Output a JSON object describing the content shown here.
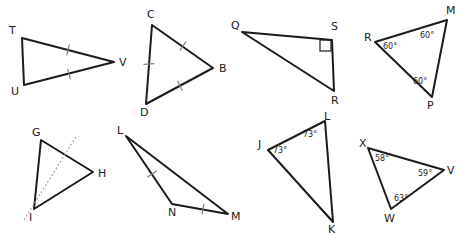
{
  "page": {
    "background_color": "#ffffff",
    "stroke_color": "#1b1b1b",
    "tick_color": "#808080",
    "dotted_color": "#9a9a9a",
    "width": 466,
    "height": 238,
    "cropped_top_text": ""
  },
  "figures": [
    {
      "id": "triangle-tuv",
      "name": "triangle-tuv",
      "vertices": [
        {
          "label": "T",
          "x": 22,
          "y": 38,
          "label_x": 9,
          "label_y": 34
        },
        {
          "label": "U",
          "x": 24,
          "y": 85,
          "label_x": 11,
          "label_y": 95
        },
        {
          "label": "V",
          "x": 114,
          "y": 62,
          "label_x": 119,
          "label_y": 66
        }
      ],
      "polygon": "22,38 114,62 24,85",
      "ticks": [
        {
          "side": "TV",
          "count": 1,
          "x": 68,
          "y": 50,
          "angle": 14
        },
        {
          "side": "UV",
          "count": 1,
          "x": 69,
          "y": 74,
          "angle": -14
        }
      ],
      "angles": [],
      "right_angle": null,
      "dotted": null
    },
    {
      "id": "triangle-cbd",
      "name": "triangle-cbd",
      "vertices": [
        {
          "label": "C",
          "x": 152,
          "y": 25,
          "label_x": 147,
          "label_y": 18
        },
        {
          "label": "B",
          "x": 213,
          "y": 68,
          "label_x": 219,
          "label_y": 72
        },
        {
          "label": "D",
          "x": 146,
          "y": 104,
          "label_x": 140,
          "label_y": 116
        }
      ],
      "polygon": "152,25 213,68 146,104",
      "ticks": [
        {
          "side": "CB",
          "count": 1,
          "x": 183,
          "y": 46,
          "angle": 35
        },
        {
          "side": "BD",
          "count": 1,
          "x": 180,
          "y": 86,
          "angle": -28
        },
        {
          "side": "CD",
          "count": 1,
          "x": 149,
          "y": 64,
          "angle": 85
        }
      ],
      "angles": [],
      "right_angle": null,
      "dotted": null
    },
    {
      "id": "triangle-qsr",
      "name": "triangle-qsr",
      "vertices": [
        {
          "label": "Q",
          "x": 242,
          "y": 32,
          "label_x": 231,
          "label_y": 29
        },
        {
          "label": "S",
          "x": 332,
          "y": 40,
          "label_x": 331,
          "label_y": 30
        },
        {
          "label": "R",
          "x": 334,
          "y": 91,
          "label_x": 331,
          "label_y": 104
        }
      ],
      "polygon": "242,32 332,40 334,91",
      "ticks": [],
      "angles": [],
      "right_angle": {
        "vertex": "S",
        "x": 320,
        "y": 40,
        "size": 11
      },
      "dotted": null
    },
    {
      "id": "triangle-rmp",
      "name": "triangle-rmp",
      "vertices": [
        {
          "label": "R",
          "x": 375,
          "y": 42,
          "label_x": 364,
          "label_y": 41
        },
        {
          "label": "M",
          "x": 447,
          "y": 20,
          "label_x": 446,
          "label_y": 14
        },
        {
          "label": "P",
          "x": 432,
          "y": 97,
          "label_x": 427,
          "label_y": 109
        }
      ],
      "polygon": "375,42 447,20 432,97",
      "ticks": [],
      "angles": [
        {
          "vertex": "R",
          "value": "60°",
          "x": 383,
          "y": 49
        },
        {
          "vertex": "M",
          "value": "60°",
          "x": 420,
          "y": 38
        },
        {
          "vertex": "P",
          "value": "60°",
          "x": 413,
          "y": 84
        }
      ],
      "right_angle": null,
      "dotted": null
    },
    {
      "id": "triangle-ghi",
      "name": "triangle-ghi",
      "vertices": [
        {
          "label": "G",
          "x": 41,
          "y": 140,
          "label_x": 32,
          "label_y": 136
        },
        {
          "label": "H",
          "x": 93,
          "y": 172,
          "label_x": 98,
          "label_y": 177
        },
        {
          "label": "I",
          "x": 34,
          "y": 209,
          "label_x": 29,
          "label_y": 221
        }
      ],
      "polygon": "41,140 93,172 34,209",
      "ticks": [],
      "angles": [],
      "right_angle": null,
      "dotted": {
        "x1": 24,
        "y1": 220,
        "x2": 76,
        "y2": 137
      }
    },
    {
      "id": "triangle-lnm",
      "name": "triangle-lnm",
      "vertices": [
        {
          "label": "L",
          "x": 126,
          "y": 136,
          "label_x": 117,
          "label_y": 134
        },
        {
          "label": "N",
          "x": 172,
          "y": 204,
          "label_x": 168,
          "label_y": 216
        },
        {
          "label": "M",
          "x": 228,
          "y": 214,
          "label_x": 231,
          "label_y": 220
        }
      ],
      "polygon": "126,136 228,214 172,204",
      "ticks": [
        {
          "side": "LN",
          "count": 1,
          "x": 152,
          "y": 174,
          "angle": 56
        },
        {
          "side": "NM",
          "count": 1,
          "x": 203,
          "y": 209,
          "angle": 10
        }
      ],
      "angles": [],
      "right_angle": null,
      "dotted": null
    },
    {
      "id": "triangle-jkl",
      "name": "triangle-jkl",
      "vertices": [
        {
          "label": "J",
          "x": 268,
          "y": 150,
          "label_x": 258,
          "label_y": 148
        },
        {
          "label": "L",
          "x": 325,
          "y": 121,
          "label_x": 324,
          "label_y": 120
        },
        {
          "label": "K",
          "x": 333,
          "y": 222,
          "label_x": 328,
          "label_y": 233
        }
      ],
      "polygon": "268,150 325,121 333,222",
      "ticks": [],
      "angles": [
        {
          "vertex": "J",
          "value": "73°",
          "x": 273,
          "y": 153
        },
        {
          "vertex": "L",
          "value": "73°",
          "x": 303,
          "y": 137
        }
      ],
      "right_angle": null,
      "dotted": null
    },
    {
      "id": "triangle-xvw",
      "name": "triangle-xvw",
      "vertices": [
        {
          "label": "X",
          "x": 368,
          "y": 148,
          "label_x": 359,
          "label_y": 147
        },
        {
          "label": "V",
          "x": 444,
          "y": 170,
          "label_x": 447,
          "label_y": 174
        },
        {
          "label": "W",
          "x": 391,
          "y": 209,
          "label_x": 384,
          "label_y": 222
        }
      ],
      "polygon": "368,148 444,170 391,209",
      "ticks": [],
      "angles": [
        {
          "vertex": "X",
          "value": "58°",
          "x": 375,
          "y": 161
        },
        {
          "vertex": "V",
          "value": "59°",
          "x": 418,
          "y": 176
        },
        {
          "vertex": "W",
          "value": "63°",
          "x": 394,
          "y": 201
        }
      ],
      "right_angle": null,
      "dotted": null
    }
  ]
}
